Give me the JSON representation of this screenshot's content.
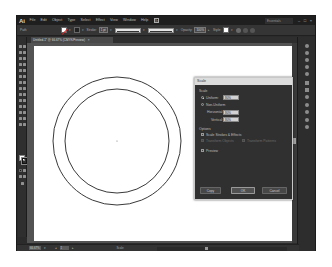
{
  "app": {
    "logo": "Ai",
    "menu": [
      "File",
      "Edit",
      "Object",
      "Type",
      "Select",
      "Effect",
      "View",
      "Window",
      "Help"
    ],
    "bridge_label": "Br",
    "workspace": "Essentials",
    "window_controls": [
      "–",
      "□",
      "×"
    ]
  },
  "controlbar": {
    "selection_label": "Path",
    "stroke_label": "Stroke:",
    "stroke_value": "1 pt",
    "brush_label": "Uniform",
    "style_label": "Basic",
    "opacity_label": "Opacity:",
    "opacity_value": "100%",
    "style_text": "Style:"
  },
  "document": {
    "tab_label": "Untitled-1* @ 66.67% (CMYK/Preview)",
    "tab_close": "×"
  },
  "canvas": {
    "outer_circle": {
      "cx": 113,
      "cy": 108,
      "r": 64,
      "stroke": "#222222"
    },
    "inner_circle": {
      "cx": 113,
      "cy": 108,
      "r": 52,
      "stroke": "#222222"
    }
  },
  "statusbar": {
    "zoom": "66.67%",
    "artboard": "1",
    "tool_status": "Scale"
  },
  "scale_dialog": {
    "title": "Scale",
    "section_scale": "Scale",
    "uniform_label": "Uniform:",
    "uniform_value": "80%",
    "non_uniform_label": "Non-Uniform",
    "horizontal_label": "Horizontal:",
    "horizontal_value": "80%",
    "vertical_label": "Vertical:",
    "vertical_value": "80%",
    "section_options": "Options",
    "scale_strokes_label": "Scale Strokes & Effects",
    "transform_objects_label": "Transform Objects",
    "transform_patterns_label": "Transform Patterns",
    "preview_label": "Preview",
    "buttons": {
      "copy": "Copy",
      "ok": "OK",
      "cancel": "Cancel"
    }
  }
}
